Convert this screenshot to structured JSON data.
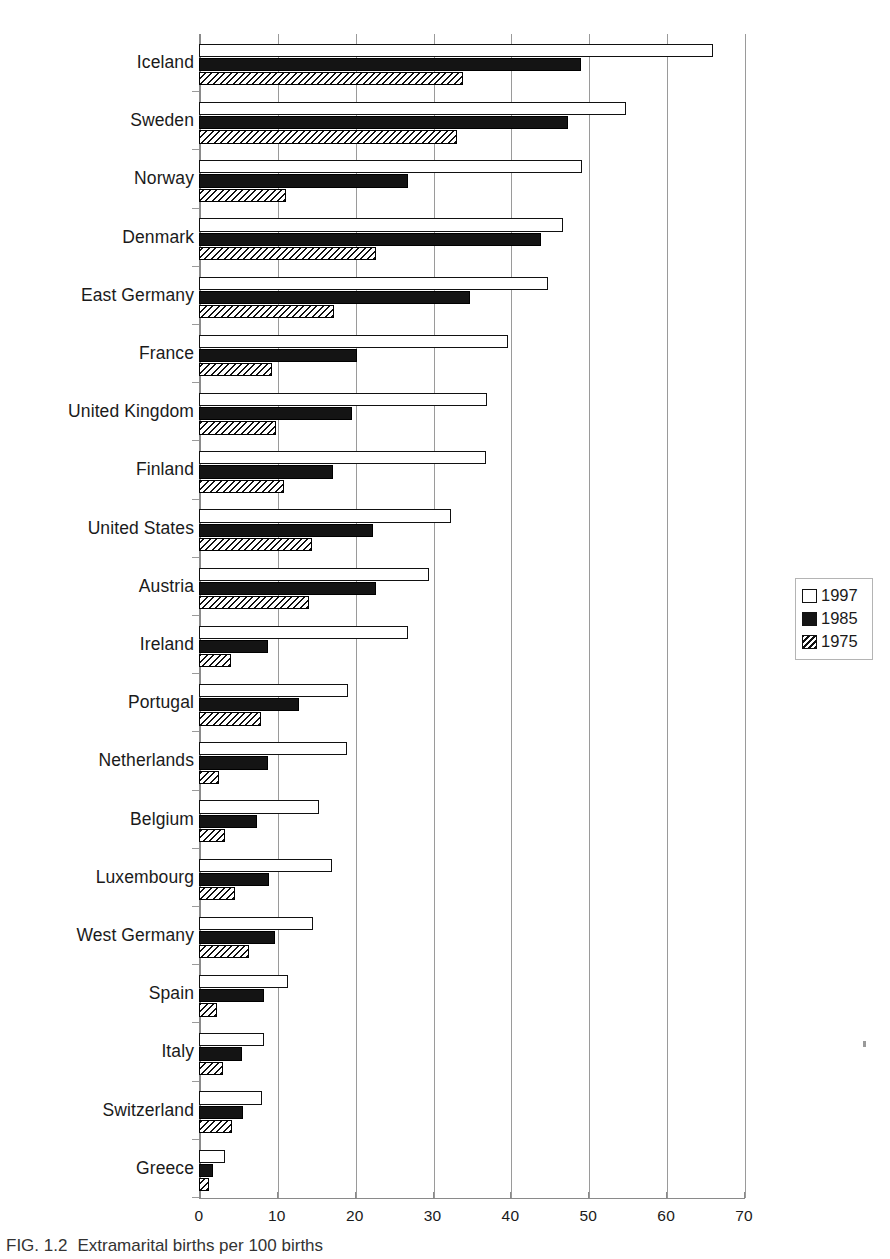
{
  "caption": {
    "figure_number": "FIG. 1.2",
    "text": "Extramarital births per 100 births"
  },
  "legend": {
    "position": "right",
    "items": [
      {
        "label": "1997",
        "swatch": "white-open-square-icon"
      },
      {
        "label": "1985",
        "swatch": "black-filled-square-icon"
      },
      {
        "label": "1975",
        "swatch": "hatched-square-icon"
      }
    ]
  },
  "axis": {
    "x_ticks": [
      "0",
      "10",
      "20",
      "30",
      "40",
      "50",
      "60",
      "70"
    ]
  },
  "chart_data": {
    "type": "bar",
    "orientation": "horizontal",
    "title": "Extramarital births per 100 births",
    "xlabel": "",
    "ylabel": "",
    "xlim": [
      0,
      70
    ],
    "grid": true,
    "legend_position": "right",
    "categories": [
      "Iceland",
      "Sweden",
      "Norway",
      "Denmark",
      "East Germany",
      "France",
      "United Kingdom",
      "Finland",
      "United States",
      "Austria",
      "Ireland",
      "Portugal",
      "Netherlands",
      "Belgium",
      "Luxembourg",
      "West Germany",
      "Spain",
      "Italy",
      "Switzerland",
      "Greece"
    ],
    "series": [
      {
        "name": "1997",
        "values": [
          66.0,
          54.8,
          49.2,
          46.8,
          44.8,
          39.7,
          37.0,
          36.9,
          32.4,
          29.5,
          26.8,
          19.1,
          19.0,
          15.4,
          17.1,
          14.7,
          11.4,
          8.4,
          8.1,
          3.3
        ]
      },
      {
        "name": "1985",
        "values": [
          49.1,
          47.4,
          26.8,
          43.9,
          34.8,
          20.3,
          19.6,
          17.2,
          22.4,
          22.7,
          8.9,
          12.9,
          8.8,
          7.4,
          9.0,
          9.7,
          8.3,
          5.5,
          5.6,
          1.8
        ]
      },
      {
        "name": "1975",
        "values": [
          33.9,
          33.2,
          11.2,
          22.7,
          17.3,
          9.4,
          9.9,
          10.9,
          14.5,
          14.1,
          4.1,
          7.9,
          2.6,
          3.4,
          4.6,
          6.4,
          2.3,
          3.1,
          4.3,
          1.3
        ]
      }
    ]
  }
}
